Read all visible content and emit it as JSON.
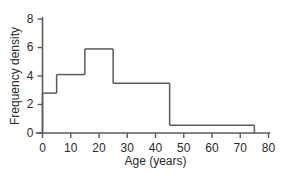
{
  "chart_data": {
    "type": "bar",
    "title": "",
    "subtitle": "",
    "xlabel": "Age (years)",
    "ylabel": "Frequency density",
    "xlim": [
      0,
      80
    ],
    "ylim": [
      0,
      8
    ],
    "xticks": [
      0,
      10,
      20,
      30,
      40,
      50,
      60,
      70,
      80
    ],
    "xtick_labels": [
      "0",
      "10",
      "20",
      "30",
      "40",
      "50",
      "60",
      "70",
      "80"
    ],
    "yticks": [
      0,
      2,
      4,
      6,
      8
    ],
    "ytick_labels": [
      "0",
      "2",
      "4",
      "6",
      "8"
    ],
    "grid": false,
    "legend": null,
    "bin_edges": [
      0,
      5,
      15,
      25,
      45,
      75
    ],
    "categories": [
      "0-5",
      "5-15",
      "15-25",
      "25-45",
      "45-75"
    ],
    "values": [
      2.8,
      4.1,
      5.9,
      3.5,
      0.55
    ],
    "bars": [
      {
        "x0": 0,
        "x1": 5,
        "height": 2.8
      },
      {
        "x0": 5,
        "x1": 15,
        "height": 4.1
      },
      {
        "x0": 15,
        "x1": 25,
        "height": 5.9
      },
      {
        "x0": 25,
        "x1": 45,
        "height": 3.5
      },
      {
        "x0": 45,
        "x1": 75,
        "height": 0.55
      }
    ],
    "colors": {
      "bar_stroke": "#5a5a5a",
      "bar_fill": "none",
      "axis": "#5a5a5a",
      "text": "#2b2b2b",
      "background": "#ffffff"
    }
  }
}
